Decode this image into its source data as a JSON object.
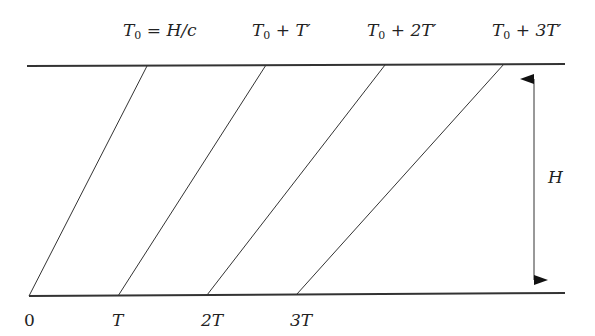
{
  "diagram": {
    "top_labels": [
      {
        "var": "T",
        "sub": "0",
        "rest": " = H/c"
      },
      {
        "var": "T",
        "sub": "0",
        "rest": " + T′"
      },
      {
        "var": "T",
        "sub": "0",
        "rest": " + 2T′"
      },
      {
        "var": "T",
        "sub": "0",
        "rest": " + 3T′"
      }
    ],
    "bottom_labels": [
      "0",
      "T",
      "2T",
      "3T"
    ],
    "height_label": "H",
    "colors": {
      "line": "#333333",
      "text": "#222222",
      "background": "#ffffff"
    }
  }
}
